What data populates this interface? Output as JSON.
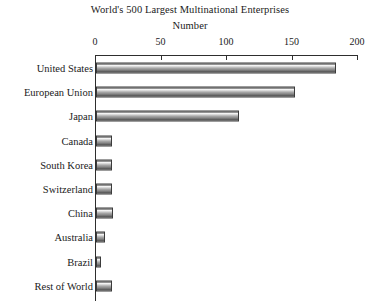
{
  "chart_data": {
    "type": "bar",
    "orientation": "horizontal",
    "title": "World's 500 Largest Multinational Enterprises",
    "subtitle": "Number",
    "xlabel": "Number",
    "ylabel": "",
    "xlim": [
      0,
      200
    ],
    "xticks": [
      0,
      50,
      100,
      150,
      200
    ],
    "xtick_labels": [
      "0",
      "50",
      "100",
      "150",
      "200"
    ],
    "grid": false,
    "legend": false,
    "axis_position": "top",
    "categories": [
      "United States",
      "European Union",
      "Japan",
      "Canada",
      "South Korea",
      "Switzerland",
      "China",
      "Australia",
      "Brazil",
      "Rest of World"
    ],
    "values": [
      183,
      152,
      109,
      12,
      12,
      12,
      13,
      7,
      4,
      12
    ],
    "series": [
      {
        "name": "Number of enterprises",
        "values": [
          183,
          152,
          109,
          12,
          12,
          12,
          13,
          7,
          4,
          12
        ]
      }
    ]
  },
  "colors": {
    "axis": "#2e2e2e",
    "bar_border": "#3b3b3b",
    "bar_light": "#f4f4f4",
    "bar_mid": "#a8a8a8",
    "bar_dark": "#424242",
    "background": "#ffffff",
    "text": "#1a1a1a"
  }
}
